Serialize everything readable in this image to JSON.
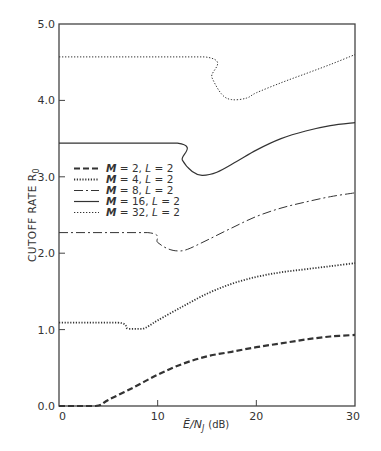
{
  "chart_data": {
    "type": "line",
    "title": "",
    "xlabel": "Ē/N_J (dB)",
    "ylabel": "CUTOFF RATE R0",
    "xlim": [
      0,
      30
    ],
    "ylim": [
      0.0,
      5.0
    ],
    "grid": false,
    "legend_position": "upper-left (inside, mid-height)",
    "x_ticks": [
      0,
      10,
      20,
      30
    ],
    "x_tick_labels": [
      "0",
      "10",
      "20",
      "30"
    ],
    "y_ticks": [
      0.0,
      1.0,
      2.0,
      3.0,
      4.0,
      5.0
    ],
    "y_tick_labels": [
      "0.0",
      "1.0",
      "2.0",
      "3.0",
      "4.0",
      "5.0"
    ],
    "series": [
      {
        "name": "M = 2, L = 2",
        "style": "dashed-heavy",
        "x": [
          0,
          3.7,
          5,
          7.5,
          10,
          12.5,
          15,
          17.5,
          20,
          22.5,
          25,
          27.5,
          30
        ],
        "values": [
          0.0,
          0.0,
          0.08,
          0.24,
          0.41,
          0.55,
          0.65,
          0.71,
          0.77,
          0.82,
          0.87,
          0.91,
          0.93
        ]
      },
      {
        "name": "M = 4, L = 2",
        "style": "dotted-heavy",
        "x": [
          0,
          6,
          7,
          8.5,
          10,
          12.5,
          15,
          17.5,
          20,
          22.5,
          25,
          27.5,
          30
        ],
        "values": [
          1.09,
          1.09,
          1.01,
          1.01,
          1.12,
          1.3,
          1.47,
          1.6,
          1.69,
          1.75,
          1.79,
          1.83,
          1.87
        ]
      },
      {
        "name": "M = 8, L = 2",
        "style": "dash-dot",
        "x": [
          0,
          9,
          10,
          11,
          12,
          13,
          15,
          17.5,
          20,
          22.5,
          25,
          27.5,
          30
        ],
        "values": [
          2.27,
          2.27,
          2.14,
          2.06,
          2.03,
          2.05,
          2.17,
          2.33,
          2.48,
          2.59,
          2.67,
          2.74,
          2.79
        ]
      },
      {
        "name": "M = 16, L = 2",
        "style": "solid",
        "x": [
          0,
          12,
          12.5,
          13.5,
          14.5,
          16,
          18,
          20,
          22.5,
          25,
          27.5,
          30
        ],
        "values": [
          3.44,
          3.44,
          3.22,
          3.07,
          3.02,
          3.06,
          3.2,
          3.35,
          3.5,
          3.6,
          3.67,
          3.71
        ]
      },
      {
        "name": "M = 32, L = 2",
        "style": "dotted-fine",
        "x": [
          0,
          14.8,
          15.5,
          16.5,
          17.5,
          19,
          20,
          22.5,
          25,
          27.5,
          30
        ],
        "values": [
          4.57,
          4.57,
          4.3,
          4.08,
          4.01,
          4.03,
          4.1,
          4.23,
          4.35,
          4.47,
          4.6
        ]
      }
    ]
  },
  "labels": {
    "x_axis_main": "Ē/N",
    "x_axis_sub": "J",
    "x_axis_unit": "(dB)",
    "y_axis_main": "CUTOFF RATE R",
    "y_axis_sub": "0"
  },
  "legend": [
    {
      "m": "M",
      "eq1": " = 2, ",
      "l": "L",
      "eq2": " = 2"
    },
    {
      "m": "M",
      "eq1": " = 4, ",
      "l": "L",
      "eq2": " = 2"
    },
    {
      "m": "M",
      "eq1": " = 8, ",
      "l": "L",
      "eq2": " = 2"
    },
    {
      "m": "M",
      "eq1": " = 16, ",
      "l": "L",
      "eq2": " = 2"
    },
    {
      "m": "M",
      "eq1": " = 32, ",
      "l": "L",
      "eq2": " = 2"
    }
  ],
  "colors": {
    "axis": "#444444",
    "line": "#333333",
    "text": "#333333"
  }
}
